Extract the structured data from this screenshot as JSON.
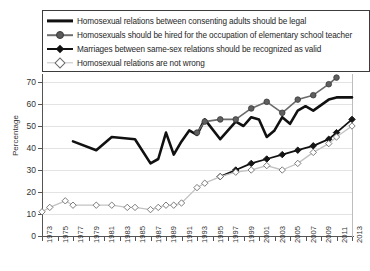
{
  "chart_data": {
    "type": "line",
    "title": "",
    "xlabel": "",
    "ylabel": "Percentage",
    "ylim": [
      0,
      70
    ],
    "ytick_values": [
      0,
      10,
      20,
      30,
      40,
      50,
      60,
      70
    ],
    "xlim": [
      1973,
      2013
    ],
    "xtick_values": [
      1973,
      1975,
      1977,
      1979,
      1981,
      1983,
      1985,
      1987,
      1989,
      1991,
      1993,
      1995,
      1997,
      1999,
      2001,
      2003,
      2005,
      2007,
      2009,
      2011,
      2013
    ],
    "grid": "horizontal",
    "legend_position": "top",
    "series": [
      {
        "name": "Homosexual relations between consenting adults should be legal",
        "marker": "none",
        "color": "#111111",
        "points": [
          [
            1977,
            43
          ],
          [
            1980,
            39
          ],
          [
            1982,
            45
          ],
          [
            1985,
            44
          ],
          [
            1987,
            33
          ],
          [
            1988,
            35
          ],
          [
            1989,
            47
          ],
          [
            1990,
            37
          ],
          [
            1991,
            43
          ],
          [
            1992,
            48
          ],
          [
            1993,
            46
          ],
          [
            1994,
            53
          ],
          [
            1996,
            44
          ],
          [
            1998,
            52
          ],
          [
            1999,
            50
          ],
          [
            2000,
            54
          ],
          [
            2001,
            53
          ],
          [
            2002,
            45
          ],
          [
            2003,
            48
          ],
          [
            2004,
            54
          ],
          [
            2005,
            51
          ],
          [
            2006,
            57
          ],
          [
            2007,
            59
          ],
          [
            2008,
            57
          ],
          [
            2010,
            62
          ],
          [
            2011,
            63
          ],
          [
            2013,
            63
          ]
        ]
      },
      {
        "name": "Homosexuals should be hired for the occupation of elementary school teacher",
        "marker": "filled-circle",
        "color": "#6a6a6a",
        "points": [
          [
            1993,
            47
          ],
          [
            1994,
            52
          ],
          [
            1996,
            53
          ],
          [
            1998,
            53
          ],
          [
            2000,
            58
          ],
          [
            2002,
            61
          ],
          [
            2004,
            56
          ],
          [
            2006,
            62
          ],
          [
            2008,
            64
          ],
          [
            2010,
            69
          ],
          [
            2011,
            72
          ]
        ]
      },
      {
        "name": "Marriages between same-sex relations should be recognized as valid",
        "marker": "filled-diamond",
        "color": "#111111",
        "points": [
          [
            1996,
            27
          ],
          [
            1998,
            30
          ],
          [
            2000,
            33
          ],
          [
            2002,
            35
          ],
          [
            2004,
            37
          ],
          [
            2006,
            39
          ],
          [
            2008,
            41
          ],
          [
            2010,
            44
          ],
          [
            2011,
            47
          ],
          [
            2013,
            53
          ]
        ]
      },
      {
        "name": "Homosexual relations are not wrong",
        "marker": "open-diamond",
        "color": "#c2c2c2",
        "points": [
          [
            1973,
            11
          ],
          [
            1974,
            13
          ],
          [
            1976,
            16
          ],
          [
            1977,
            14
          ],
          [
            1980,
            14
          ],
          [
            1982,
            14
          ],
          [
            1984,
            13
          ],
          [
            1985,
            13
          ],
          [
            1987,
            12
          ],
          [
            1988,
            13
          ],
          [
            1989,
            14
          ],
          [
            1990,
            14
          ],
          [
            1991,
            15
          ],
          [
            1993,
            22
          ],
          [
            1994,
            24
          ],
          [
            1996,
            27
          ],
          [
            1998,
            29
          ],
          [
            2000,
            30
          ],
          [
            2002,
            32
          ],
          [
            2004,
            30
          ],
          [
            2006,
            33
          ],
          [
            2008,
            38
          ],
          [
            2010,
            42
          ],
          [
            2011,
            45
          ],
          [
            2013,
            50
          ]
        ]
      }
    ]
  },
  "legend": {
    "items": [
      {
        "label": "Homosexual relations between consenting adults should be legal",
        "key": "thick-line"
      },
      {
        "label": "Homosexuals should be hired for the occupation of elementary school teacher",
        "key": "gray-line-circle"
      },
      {
        "label": "Marriages between same-sex relations should be recognized as valid",
        "key": "black-line-diamond"
      },
      {
        "label": "Homosexual relations are not wrong",
        "key": "light-line-open-diamond"
      }
    ]
  }
}
